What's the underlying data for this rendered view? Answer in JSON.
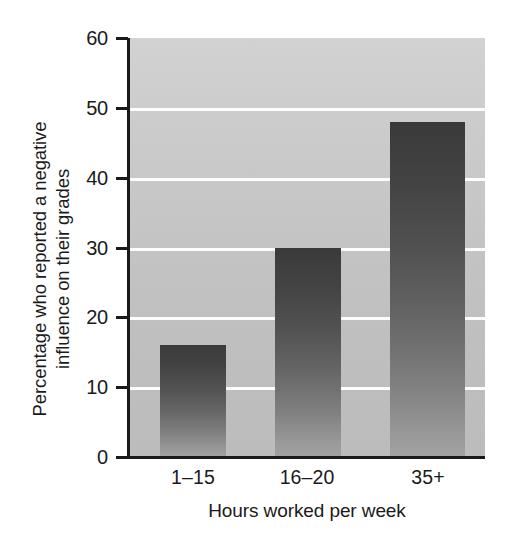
{
  "chart_data": {
    "type": "bar",
    "title": "",
    "subtitle": "",
    "xlabel": "Hours worked per week",
    "ylabel": "Percentage who reported a negative influence on their grades",
    "ylabel_lines": [
      "Percentage who reported a negative",
      "influence on their grades"
    ],
    "categories": [
      "1–15",
      "16–20",
      "35+"
    ],
    "values": [
      16,
      30,
      48
    ],
    "ylim": [
      0,
      60
    ],
    "xlim": [
      0,
      3
    ],
    "yticks": [
      0,
      10,
      20,
      30,
      40,
      50,
      60
    ],
    "ytick_labels": [
      "0",
      "10",
      "20",
      "30",
      "40",
      "50",
      "60"
    ],
    "grid": "horizontal-white-gridlines",
    "legend": "none",
    "legend_position": "none",
    "annotations": [],
    "bar_fill": "vertical-gradient-dark-to-light",
    "colors": {
      "bar_top": "#3a3a3a",
      "bar_bottom": "#a2a2a2",
      "plot_background_top": "#d2d2d2",
      "plot_background_bottom": "#bcbcbc",
      "gridline": "#fdfdfd",
      "axis": "#1a1a1a",
      "text": "#1a1a1a",
      "page_background": "#ffffff"
    }
  },
  "axis": {
    "y_title_line1": "Percentage who reported a negative",
    "y_title_line2": "influence on their grades",
    "x_title": "Hours worked per week",
    "ytick_0": "0",
    "ytick_10": "10",
    "ytick_20": "20",
    "ytick_30": "30",
    "ytick_40": "40",
    "ytick_50": "50",
    "ytick_60": "60",
    "cat_0": "1–15",
    "cat_1": "16–20",
    "cat_2": "35+"
  }
}
